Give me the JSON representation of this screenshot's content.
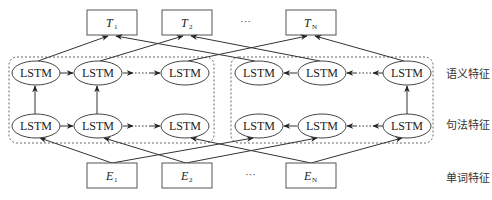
{
  "diagram": {
    "node_label": "LSTM",
    "ellipsis": "···",
    "outputs": [
      {
        "var": "T",
        "sub": "1"
      },
      {
        "var": "T",
        "sub": "2"
      },
      {
        "var": "T",
        "sub": "N"
      }
    ],
    "inputs": [
      {
        "var": "E",
        "sub": "1"
      },
      {
        "var": "E",
        "sub": "2"
      },
      {
        "var": "E",
        "sub": "N"
      }
    ],
    "layer_labels": {
      "semantic": "语义特征",
      "syntactic": "句法特征",
      "word": "单词特征"
    },
    "groups": {
      "forward": {
        "direction": "left-to-right",
        "rows": 2,
        "nodes_per_row": 3
      },
      "backward": {
        "direction": "right-to-left",
        "rows": 2,
        "nodes_per_row": 3
      }
    },
    "colors": {
      "stroke": "#444444",
      "text": "#222222",
      "background": "#ffffff"
    }
  }
}
